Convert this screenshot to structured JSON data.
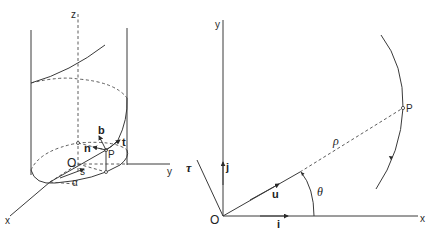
{
  "figure": {
    "left_diagram": {
      "title": "helix on cylinder with Frenet frame",
      "axis_labels": {
        "z": "z",
        "x": "x",
        "y": "y"
      },
      "origin_label": "O",
      "point_label": "P",
      "vector_labels": {
        "b": "b",
        "n": "n",
        "t": "t"
      },
      "arc_label": "s",
      "angle_label": "α"
    },
    "right_diagram": {
      "title": "polar coordinates with unit vectors",
      "axis_labels": {
        "x": "x",
        "y": "y"
      },
      "origin_label": "O",
      "point_label": "P",
      "radius_label": "ρ",
      "angle_label": "θ",
      "vector_labels": {
        "i": "i",
        "j": "j",
        "u": "u",
        "tau": "τ"
      }
    }
  },
  "colors": {
    "ink": "#2a2a2a",
    "background": "#ffffff"
  }
}
